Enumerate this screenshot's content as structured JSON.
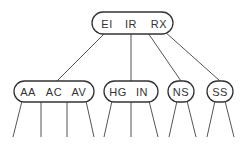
{
  "diagram": {
    "type": "b-tree",
    "root": {
      "keys": [
        "EI",
        "IR",
        "RX"
      ]
    },
    "children": [
      {
        "keys": [
          "AA",
          "AC",
          "AV"
        ]
      },
      {
        "keys": [
          "HG",
          "IN"
        ]
      },
      {
        "keys": [
          "NS"
        ]
      },
      {
        "keys": [
          "SS"
        ]
      }
    ],
    "colors": {
      "stroke": "#333333",
      "text": "#333333",
      "background": "#ffffff"
    }
  }
}
